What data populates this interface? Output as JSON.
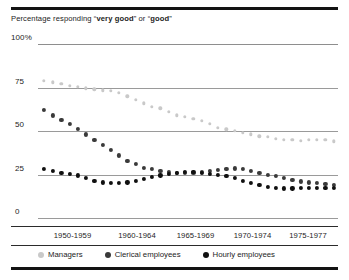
{
  "figure": {
    "title_prefix": "Percentage responding “",
    "title_bold1": "very good",
    "title_mid": "” or “",
    "title_bold2": "good",
    "title_suffix": "”"
  },
  "chart_data": {
    "type": "scatter",
    "title": "Percentage responding “very good” or “good”",
    "xlabel": "",
    "ylabel": "",
    "ylim": [
      0,
      100
    ],
    "yticks": [
      0,
      25,
      50,
      75,
      100
    ],
    "ytick_labels": [
      "0",
      "25",
      "50",
      "75",
      "100%"
    ],
    "grid": true,
    "legend_position": "bottom",
    "xtick_labels": [
      "1950-1959",
      "1960-1964",
      "1965-1969",
      "1970-1974",
      "1975-1977"
    ],
    "xtick_positions": [
      0.115,
      0.33,
      0.525,
      0.715,
      0.9
    ],
    "colors": {
      "managers": "#c9c9c9",
      "clerical": "#3a3a3a",
      "hourly": "#101010"
    },
    "series": [
      {
        "name": "Managers",
        "color": "#c9c9c9",
        "x": [
          0.02,
          0.05,
          0.078,
          0.105,
          0.133,
          0.16,
          0.188,
          0.215,
          0.243,
          0.27,
          0.298,
          0.325,
          0.353,
          0.38,
          0.408,
          0.435,
          0.463,
          0.49,
          0.518,
          0.545,
          0.573,
          0.6,
          0.628,
          0.655,
          0.683,
          0.71,
          0.738,
          0.765,
          0.793,
          0.82,
          0.848,
          0.875,
          0.903,
          0.93,
          0.958,
          0.985
        ],
        "y": [
          79,
          78,
          77,
          76,
          75.5,
          74.5,
          74,
          73.5,
          73,
          72,
          70,
          68,
          66,
          64,
          63,
          61,
          59,
          58,
          57,
          56,
          54,
          52,
          51,
          50,
          49,
          48,
          47,
          46.5,
          45.5,
          45,
          45,
          44.5,
          45,
          45,
          45,
          44
        ]
      },
      {
        "name": "Clerical employees",
        "color": "#3a3a3a",
        "x": [
          0.02,
          0.05,
          0.078,
          0.105,
          0.133,
          0.16,
          0.188,
          0.215,
          0.243,
          0.27,
          0.298,
          0.325,
          0.353,
          0.38,
          0.408,
          0.435,
          0.463,
          0.49,
          0.518,
          0.545,
          0.573,
          0.6,
          0.628,
          0.655,
          0.683,
          0.71,
          0.738,
          0.765,
          0.793,
          0.82,
          0.848,
          0.875,
          0.903,
          0.93,
          0.958,
          0.985
        ],
        "y": [
          62,
          59,
          56.5,
          54,
          51,
          48,
          45,
          42,
          39,
          36,
          33,
          31,
          29,
          28,
          27,
          26.5,
          26,
          26,
          26,
          26.5,
          27,
          27.5,
          28,
          28.5,
          28,
          27,
          26,
          25,
          24,
          23,
          22,
          21,
          20.5,
          20,
          19.5,
          19
        ]
      },
      {
        "name": "Hourly employees",
        "color": "#101010",
        "x": [
          0.02,
          0.05,
          0.078,
          0.105,
          0.133,
          0.16,
          0.188,
          0.215,
          0.243,
          0.27,
          0.298,
          0.325,
          0.353,
          0.38,
          0.408,
          0.435,
          0.463,
          0.49,
          0.518,
          0.545,
          0.573,
          0.6,
          0.628,
          0.655,
          0.683,
          0.71,
          0.738,
          0.765,
          0.793,
          0.82,
          0.848,
          0.875,
          0.903,
          0.93,
          0.958,
          0.985
        ],
        "y": [
          28,
          27,
          26,
          25.5,
          24.5,
          23,
          21.5,
          20.5,
          20,
          20,
          20.5,
          21.5,
          22.5,
          23.5,
          24.5,
          25.5,
          26,
          26.5,
          26.5,
          26,
          25.5,
          25,
          24,
          23,
          21.5,
          20,
          19,
          18,
          17.5,
          17,
          17,
          17.5,
          17.5,
          17.5,
          17.5,
          17.5
        ]
      }
    ]
  },
  "legend": [
    {
      "label": "Managers",
      "color": "#c9c9c9"
    },
    {
      "label": "Clerical employees",
      "color": "#3a3a3a"
    },
    {
      "label": "Hourly employees",
      "color": "#101010"
    }
  ]
}
